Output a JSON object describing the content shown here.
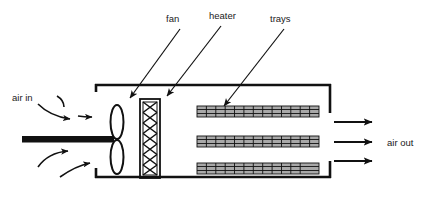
{
  "diagram": {
    "background_color": "#ffffff",
    "line_color": "#111111",
    "tray_fill_color": "#a8a8a8",
    "labels": {
      "fan": "fan",
      "heater": "heater",
      "trays": "trays",
      "air_in": "air in",
      "air_out": "air out"
    },
    "components": {
      "enclosure": {
        "name": "enclosure-duct",
        "left": 93,
        "right": 330,
        "top": 84,
        "bottom": 178
      },
      "fan": {
        "name": "fan",
        "blade_count": 2,
        "hub_x": 113,
        "hub_y": 140
      },
      "heater": {
        "name": "heater",
        "x": 140,
        "y": 99,
        "width": 20,
        "height": 78,
        "pattern": "cross-hatch",
        "rows": 7
      },
      "trays": {
        "name": "trays",
        "count": 3,
        "x": 197,
        "width": 122,
        "height": 11,
        "cells_per_tray": 13,
        "y_positions": [
          106,
          136,
          163
        ]
      },
      "inlet_arrows": {
        "name": "air-inlet-arrows",
        "count": 4
      },
      "outlet_arrows": {
        "name": "air-outlet-arrows",
        "count": 3
      }
    },
    "leader_lines": [
      {
        "label": "fan",
        "from_x": 181,
        "from_y": 28,
        "to_x": 128,
        "to_y": 100
      },
      {
        "label": "heater",
        "from_x": 222,
        "from_y": 25,
        "to_x": 165,
        "to_y": 98
      },
      {
        "label": "trays",
        "from_x": 285,
        "from_y": 28,
        "to_x": 222,
        "to_y": 110
      }
    ]
  }
}
